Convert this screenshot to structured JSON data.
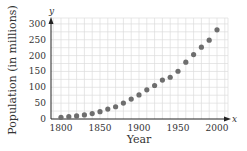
{
  "chart_data": {
    "type": "scatter",
    "title": "",
    "xlabel": "Year",
    "ylabel": "Population (in millions)",
    "x_axis_var": "x",
    "y_axis_var": "y",
    "x_ticks": [
      1800,
      1850,
      1900,
      1950,
      2000
    ],
    "y_ticks": [
      0,
      50,
      100,
      150,
      200,
      250,
      300
    ],
    "xlim": [
      1787,
      2014
    ],
    "ylim": [
      0,
      320
    ],
    "grid": true,
    "legend": null,
    "x": [
      1800,
      1810,
      1820,
      1830,
      1840,
      1850,
      1860,
      1870,
      1880,
      1890,
      1900,
      1910,
      1920,
      1930,
      1940,
      1950,
      1960,
      1970,
      1980,
      1990,
      2000
    ],
    "y": [
      5.3,
      7.2,
      9.6,
      12.9,
      17.1,
      23.2,
      31.4,
      38.6,
      50.2,
      62.9,
      76.0,
      92.0,
      105.7,
      122.8,
      131.7,
      150.7,
      179.3,
      203.3,
      226.5,
      248.7,
      281.4
    ],
    "colors": {
      "points": "#6e6e6e",
      "axis": "#222222",
      "grid": "#dcdcdc"
    }
  }
}
